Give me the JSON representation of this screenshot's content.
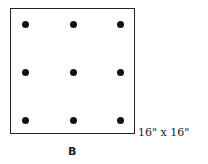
{
  "diagram": {
    "dimension_label": "16\" x 16\"",
    "figure_label": "B",
    "grid": {
      "rows": 3,
      "cols": 3
    },
    "dots": [
      {
        "x": 25,
        "y": 24
      },
      {
        "x": 73,
        "y": 24
      },
      {
        "x": 120,
        "y": 24
      },
      {
        "x": 25,
        "y": 72
      },
      {
        "x": 73,
        "y": 72
      },
      {
        "x": 120,
        "y": 72
      },
      {
        "x": 25,
        "y": 120
      },
      {
        "x": 73,
        "y": 120
      },
      {
        "x": 120,
        "y": 120
      }
    ]
  }
}
